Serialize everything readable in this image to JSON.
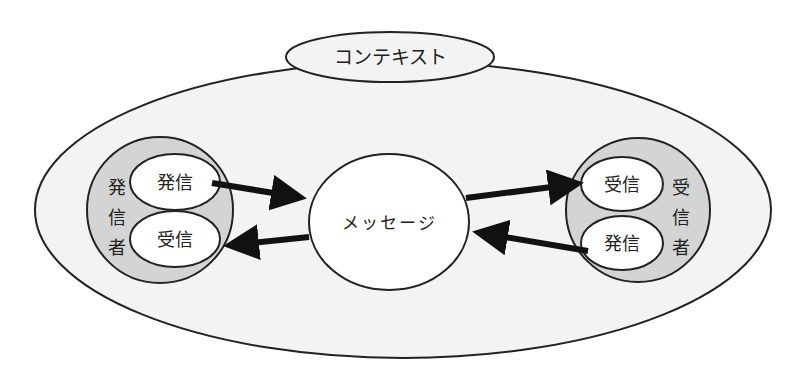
{
  "diagram": {
    "context_label": "コンテキスト",
    "message_label": "メッセージ",
    "sender": {
      "label_chars": [
        "発",
        "信",
        "者"
      ],
      "send_label": "発信",
      "receive_label": "受信"
    },
    "receiver": {
      "label_chars": [
        "受",
        "信",
        "者"
      ],
      "receive_label": "受信",
      "send_label": "発信"
    },
    "arrows": [
      {
        "from": "sender.発信",
        "to": "メッセージ"
      },
      {
        "from": "メッセージ",
        "to": "sender.受信"
      },
      {
        "from": "メッセージ",
        "to": "receiver.受信"
      },
      {
        "from": "receiver.発信",
        "to": "メッセージ"
      }
    ],
    "colors": {
      "outer_fill": "#f3f3f3",
      "party_fill": "#d4d4d4",
      "node_fill": "#ffffff",
      "stroke": "#222222",
      "arrow": "#111111"
    }
  }
}
